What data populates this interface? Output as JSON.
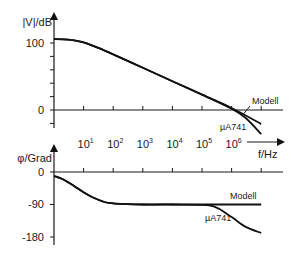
{
  "chart_data": [
    {
      "type": "line",
      "title": "Bode magnitude",
      "xlabel": "f/Hz",
      "ylabel": "|V|/dB",
      "x_scale": "log",
      "xlim": [
        1,
        10000000
      ],
      "ylim": [
        -20,
        100
      ],
      "x_ticks": [
        {
          "value": 10,
          "base": "10",
          "exp": "1"
        },
        {
          "value": 100,
          "base": "10",
          "exp": "2"
        },
        {
          "value": 1000,
          "base": "10",
          "exp": "3"
        },
        {
          "value": 10000,
          "base": "10",
          "exp": "4"
        },
        {
          "value": 100000,
          "base": "10",
          "exp": "5"
        },
        {
          "value": 1000000,
          "base": "10",
          "exp": "6"
        }
      ],
      "y_tick_labels": [
        {
          "value": 100,
          "label": "100"
        },
        {
          "value": 0,
          "label": "0"
        }
      ],
      "y_minor_ticks": [
        80,
        60,
        40,
        20,
        -20
      ],
      "series": [
        {
          "name": "Modell",
          "x": [
            1,
            3,
            10,
            30,
            100,
            1000,
            10000,
            100000,
            1000000,
            10000000
          ],
          "y": [
            106,
            105,
            101,
            93,
            83,
            63,
            43,
            23,
            3,
            -21
          ]
        },
        {
          "name": "µA741",
          "x": [
            1,
            3,
            10,
            30,
            100,
            1000,
            10000,
            100000,
            1000000,
            3000000,
            10000000
          ],
          "y": [
            106,
            105,
            101,
            93,
            83,
            63,
            43,
            23,
            2,
            -12,
            -36
          ]
        }
      ],
      "annotations": [
        "Modell",
        "µA741"
      ]
    },
    {
      "type": "line",
      "title": "Bode phase",
      "xlabel": "f/Hz",
      "ylabel": "φ/Grad",
      "x_scale": "log",
      "xlim": [
        1,
        10000000
      ],
      "ylim": [
        -180,
        0
      ],
      "y_tick_labels": [
        {
          "value": 0,
          "label": "0"
        },
        {
          "value": -90,
          "label": "-90"
        },
        {
          "value": -180,
          "label": "-180"
        }
      ],
      "series": [
        {
          "name": "Modell",
          "x": [
            1,
            2,
            5,
            10,
            20,
            50,
            100,
            300,
            1000,
            10000,
            100000,
            1000000,
            10000000
          ],
          "y": [
            -11,
            -20,
            -40,
            -56,
            -70,
            -83,
            -87,
            -89,
            -90,
            -90,
            -90,
            -90,
            -90
          ]
        },
        {
          "name": "µA741",
          "x": [
            1,
            2,
            5,
            10,
            20,
            50,
            100,
            300,
            1000,
            10000,
            100000,
            300000,
            1000000,
            3000000,
            10000000
          ],
          "y": [
            -11,
            -20,
            -40,
            -56,
            -70,
            -83,
            -87,
            -89,
            -90,
            -90,
            -91,
            -98,
            -125,
            -152,
            -169
          ]
        }
      ],
      "annotations": [
        "Modell",
        "µA741"
      ]
    }
  ]
}
